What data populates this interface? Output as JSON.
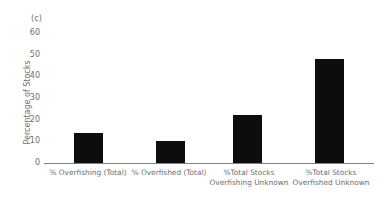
{
  "figure": {
    "panel_label": "(c)",
    "bar_color": "#0d0d0d",
    "axis_color": "#808285",
    "text_color": "#6d6e71"
  },
  "chart_data": {
    "type": "bar",
    "title": "",
    "subtitle": "",
    "xlabel": "",
    "ylabel": "Percentage of Stocks",
    "ylim": [
      0,
      60
    ],
    "yticks": [
      0,
      10,
      20,
      30,
      40,
      50,
      60
    ],
    "ytick_labels": [
      "0",
      "10",
      "20",
      "30",
      "40",
      "50",
      "60"
    ],
    "grid": false,
    "legend": false,
    "categories": [
      "% Overfishing (Total)",
      "% Overfished (Total)",
      "%Total Stocks Overfishing Unknown",
      "%Total Stocks Overfished Unknown"
    ],
    "category_lines": [
      [
        "% Overfishing (Total)"
      ],
      [
        "% Overfished (Total)"
      ],
      [
        "%Total Stocks",
        "Overfishing Unknown"
      ],
      [
        "%Total Stocks",
        "Overfished Unknown"
      ]
    ],
    "values": [
      14,
      10,
      22,
      48
    ],
    "series": [
      {
        "name": "Percentage of Stocks",
        "values": [
          14,
          10,
          22,
          48
        ]
      }
    ]
  }
}
